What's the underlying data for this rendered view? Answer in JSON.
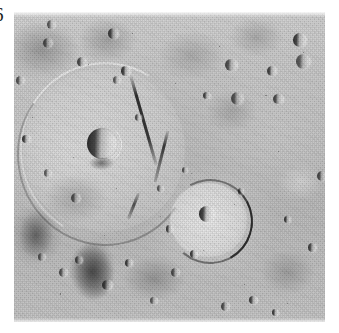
{
  "plate": {
    "figure_number": "6",
    "image_kind": "planetary-surface-photograph",
    "description": "Grayscale spacecraft photograph of a heavily cratered planetary surface",
    "palette": {
      "paper": "#ffffff",
      "regolith_light": "#d5d5d5",
      "regolith_mid": "#c4c4c4",
      "regolith_dark": "#8a8a8a",
      "shadow": "#1d1d1d",
      "highlight": "#f2f2f2"
    },
    "geometry": {
      "canvas_width": 339,
      "canvas_height": 333,
      "photo_left": 14,
      "photo_top": 12,
      "photo_width": 311,
      "photo_height": 310
    },
    "illumination": {
      "sun_direction": "from the right",
      "shadow_side": "left"
    },
    "features": [
      {
        "id": "basin-large-left",
        "label": "large degraded crater basin",
        "cx_pct": 28,
        "cy_pct": 44,
        "w_pct": 52,
        "h_pct": 52,
        "kind": "basin"
      },
      {
        "id": "crater-prominent",
        "label": "prominent bowl crater",
        "cx_pct": 28,
        "cy_pct": 42,
        "w_pct": 9.5,
        "h_pct": 9.5,
        "kind": "bowl"
      },
      {
        "id": "crater-lower-right",
        "label": "crater with central peak",
        "cx_pct": 62,
        "cy_pct": 66,
        "w_pct": 23,
        "h_pct": 22,
        "kind": "basin"
      },
      {
        "id": "crater-central-peak",
        "label": "central peak crater",
        "cx_pct": 62,
        "cy_pct": 65,
        "w_pct": 5,
        "h_pct": 5,
        "kind": "bowl"
      },
      {
        "id": "scarp-diagonal",
        "label": "diagonal rim scarp",
        "kind": "scarp"
      },
      {
        "id": "dark-patch-lower-left",
        "label": "dark ejecta patch",
        "cx_pct": 26,
        "cy_pct": 83,
        "kind": "albedo-patch"
      }
    ],
    "small_craters": [
      {
        "cx": 12,
        "cy": 4,
        "d": 3.0
      },
      {
        "cx": 11,
        "cy": 10,
        "d": 3.4
      },
      {
        "cx": 22,
        "cy": 16,
        "d": 3.2
      },
      {
        "cx": 32,
        "cy": 7,
        "d": 3.6
      },
      {
        "cx": 36,
        "cy": 19,
        "d": 3.0
      },
      {
        "cx": 33,
        "cy": 22,
        "d": 2.6
      },
      {
        "cx": 2,
        "cy": 22,
        "d": 3.0
      },
      {
        "cx": 70,
        "cy": 17,
        "d": 4.0
      },
      {
        "cx": 83,
        "cy": 19,
        "d": 3.2
      },
      {
        "cx": 92,
        "cy": 9,
        "d": 4.4
      },
      {
        "cx": 93,
        "cy": 16,
        "d": 4.8
      },
      {
        "cx": 72,
        "cy": 28,
        "d": 4.2
      },
      {
        "cx": 85,
        "cy": 28,
        "d": 3.4
      },
      {
        "cx": 62,
        "cy": 27,
        "d": 2.4
      },
      {
        "cx": 4,
        "cy": 41,
        "d": 2.8
      },
      {
        "cx": 11,
        "cy": 52,
        "d": 2.6
      },
      {
        "cx": 20,
        "cy": 60,
        "d": 3.2
      },
      {
        "cx": 99,
        "cy": 53,
        "d": 3.2
      },
      {
        "cx": 96,
        "cy": 76,
        "d": 2.8
      },
      {
        "cx": 88,
        "cy": 67,
        "d": 2.4
      },
      {
        "cx": 9,
        "cy": 79,
        "d": 2.8
      },
      {
        "cx": 16,
        "cy": 84,
        "d": 3.0
      },
      {
        "cx": 21,
        "cy": 80,
        "d": 2.6
      },
      {
        "cx": 30,
        "cy": 88,
        "d": 3.4
      },
      {
        "cx": 37,
        "cy": 81,
        "d": 2.6
      },
      {
        "cx": 45,
        "cy": 93,
        "d": 2.4
      },
      {
        "cx": 52,
        "cy": 84,
        "d": 2.8
      },
      {
        "cx": 68,
        "cy": 95,
        "d": 3.0
      },
      {
        "cx": 77,
        "cy": 93,
        "d": 2.6
      },
      {
        "cx": 84,
        "cy": 97,
        "d": 2.4
      },
      {
        "cx": 47,
        "cy": 57,
        "d": 2.2
      },
      {
        "cx": 55,
        "cy": 51,
        "d": 2.0
      },
      {
        "cx": 40,
        "cy": 34,
        "d": 2.2
      },
      {
        "cx": 50,
        "cy": 70,
        "d": 2.4
      },
      {
        "cx": 58,
        "cy": 78,
        "d": 2.6
      },
      {
        "cx": 73,
        "cy": 58,
        "d": 2.2
      }
    ]
  }
}
